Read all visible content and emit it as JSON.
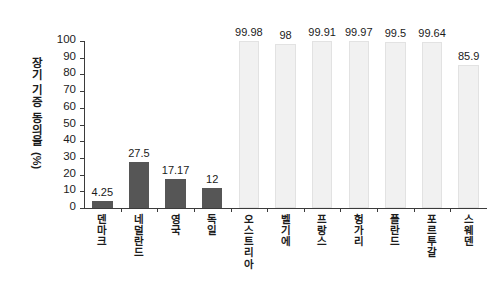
{
  "chart_data": {
    "type": "bar",
    "title": "",
    "xlabel": "",
    "ylabel": "장기 기증 동의율 (%)",
    "ylabel_chars": [
      "장",
      "기",
      "기",
      "증",
      "동",
      "의",
      "율"
    ],
    "ylabel_unit": "(%)",
    "ylim": [
      0,
      100
    ],
    "yticks": [
      0,
      10,
      20,
      30,
      40,
      50,
      60,
      70,
      80,
      90,
      100
    ],
    "ytick_labels": [
      "0",
      "10",
      "20",
      "30",
      "40",
      "50",
      "60",
      "70",
      "80",
      "90",
      "100"
    ],
    "grid": false,
    "legend": "none",
    "categories": [
      "덴마크",
      "네덜란드",
      "영국",
      "독일",
      "오스트리아",
      "벨기에",
      "프랑스",
      "헝가리",
      "폴란드",
      "포르투갈",
      "스웨덴"
    ],
    "values": [
      4.25,
      27.5,
      17.17,
      12,
      99.98,
      98,
      99.91,
      99.97,
      99.5,
      99.64,
      85.9
    ],
    "value_labels": [
      "4.25",
      "27.5",
      "17.17",
      "12",
      "99.98",
      "98",
      "99.91",
      "99.97",
      "99.5",
      "99.64",
      "85.9"
    ],
    "bar_styles": [
      "dark",
      "dark",
      "dark",
      "dark",
      "light",
      "light",
      "light",
      "light",
      "light",
      "light",
      "light"
    ],
    "colors": {
      "bar_dark": "#565656",
      "bar_light": "#f1f1f1",
      "bar_light_edge": "#e2e2e2",
      "axis": "#3b3b3b",
      "text": "#1a1a1a",
      "background": "#ffffff"
    }
  }
}
